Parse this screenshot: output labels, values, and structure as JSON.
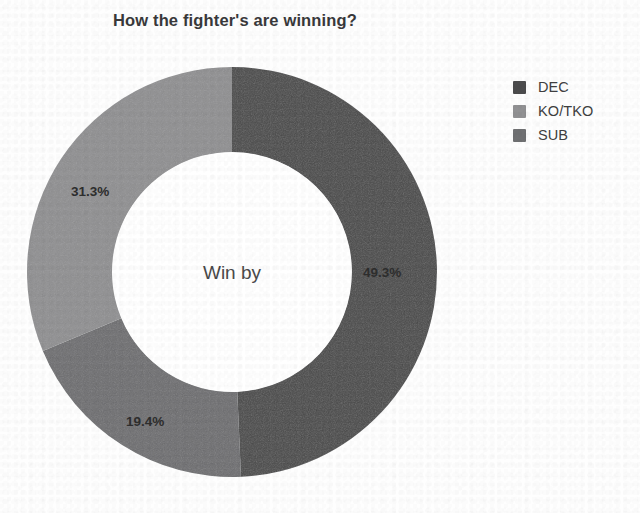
{
  "chart_data": {
    "type": "pie",
    "variant": "donut",
    "title": "How the fighter's are winning?",
    "center_label": "Win by",
    "categories": [
      "DEC",
      "KO/TKO",
      "SUB"
    ],
    "values": [
      49.3,
      31.3,
      19.4
    ],
    "value_unit": "%",
    "data_labels": [
      "49.3%",
      "31.3%",
      "19.4%"
    ],
    "colors": [
      "#4b4b4c",
      "#919193",
      "#6f7072"
    ],
    "legend_position": "right",
    "grid": false,
    "xlabel": "",
    "ylabel": "",
    "slices": [
      {
        "name": "DEC",
        "value": 49.3,
        "label": "49.3%",
        "color": "#4b4b4c",
        "start_angle": 0.0,
        "end_angle": 177.48
      },
      {
        "name": "SUB",
        "value": 19.4,
        "label": "19.4%",
        "color": "#6f7072",
        "start_angle": 177.48,
        "end_angle": 247.32
      },
      {
        "name": "KO/TKO",
        "value": 31.3,
        "label": "31.3%",
        "color": "#919193",
        "start_angle": 247.32,
        "end_angle": 360.0
      }
    ]
  },
  "title": {
    "text": "How the fighter's are winning?"
  },
  "donut": {
    "center_label": "Win by",
    "labels": {
      "dec": "49.3%",
      "kotko": "31.3%",
      "sub": "19.4%"
    }
  },
  "legend": {
    "items": [
      {
        "label": "DEC",
        "color": "#4b4b4c"
      },
      {
        "label": "KO/TKO",
        "color": "#919193"
      },
      {
        "label": "SUB",
        "color": "#6f7072"
      }
    ]
  }
}
